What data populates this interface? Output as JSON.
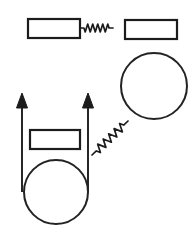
{
  "figure": {
    "background_color": "#ffffff",
    "stroke_color": "#1c1c1c",
    "width": 193,
    "height": 234,
    "caption": ""
  },
  "chart_data": {
    "type": "diagram",
    "coordinate_space": {
      "width": 193,
      "height": 234,
      "units": "px",
      "origin": "top-left"
    },
    "elements": [
      {
        "id": "block-top-left",
        "kind": "rectangle",
        "label": "block",
        "x": 28,
        "y": 19,
        "width": 52,
        "height": 19,
        "stroke": "#1c1c1c",
        "stroke_width": 2.2,
        "fill": "#ffffff"
      },
      {
        "id": "spring-top",
        "kind": "spring",
        "label": "spring",
        "orientation": "horizontal",
        "x1": 80,
        "y1": 28,
        "x2": 113,
        "y2": 28,
        "coils": 5,
        "amplitude": 4,
        "stroke": "#1c1c1c",
        "stroke_width": 1.7
      },
      {
        "id": "block-top-right",
        "kind": "rectangle",
        "label": "block",
        "x": 125,
        "y": 20,
        "width": 52,
        "height": 19,
        "stroke": "#1c1c1c",
        "stroke_width": 2.2,
        "fill": "#ffffff"
      },
      {
        "id": "circle-right",
        "kind": "circle",
        "label": "disk",
        "cx": 154,
        "cy": 86,
        "r": 33,
        "stroke": "#232323",
        "stroke_width": 2.0,
        "fill": "#ffffff"
      },
      {
        "id": "vector-left",
        "kind": "arrow",
        "label": "force vector",
        "direction": "up",
        "x1": 22,
        "y1": 192,
        "x2": 22,
        "y2": 93,
        "head_width": 11,
        "head_length": 15,
        "stroke": "#1c1c1c",
        "stroke_width": 1.9
      },
      {
        "id": "vector-right",
        "kind": "arrow",
        "label": "force vector",
        "direction": "up",
        "x1": 88,
        "y1": 192,
        "x2": 88,
        "y2": 93,
        "head_width": 11,
        "head_length": 15,
        "stroke": "#1c1c1c",
        "stroke_width": 1.9
      },
      {
        "id": "block-lower",
        "kind": "rectangle",
        "label": "block",
        "x": 30,
        "y": 130,
        "width": 50,
        "height": 19,
        "stroke": "#1c1c1c",
        "stroke_width": 2.2,
        "fill": "#ffffff"
      },
      {
        "id": "circle-lower",
        "kind": "circle",
        "label": "disk",
        "cx": 56,
        "cy": 192,
        "r": 32,
        "stroke": "#232323",
        "stroke_width": 2.0,
        "fill": "#ffffff"
      },
      {
        "id": "spring-diagonal",
        "kind": "spring",
        "label": "spring",
        "orientation": "diagonal",
        "x1": 92,
        "y1": 155,
        "x2": 128,
        "y2": 121,
        "coils": 5,
        "amplitude": 4,
        "stroke": "#1c1c1c",
        "stroke_width": 1.7
      }
    ],
    "legend": [],
    "annotations": []
  }
}
